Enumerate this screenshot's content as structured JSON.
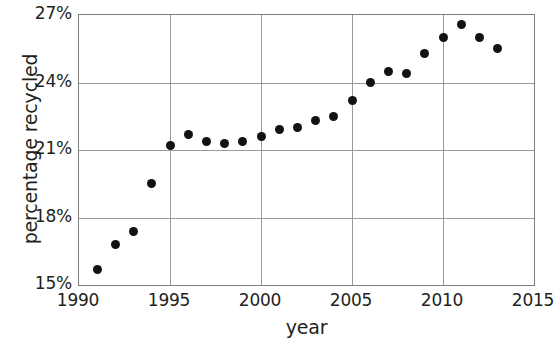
{
  "chart_data": {
    "type": "scatter",
    "title": "",
    "xlabel": "year",
    "ylabel": "percentage recycled",
    "xlim": [
      1990,
      2015
    ],
    "ylim": [
      15,
      27
    ],
    "xticks": [
      1990,
      1995,
      2000,
      2005,
      2010,
      2015
    ],
    "xtick_labels": [
      "1990",
      "1995",
      "2000",
      "2005",
      "2010",
      "2015"
    ],
    "yticks": [
      15,
      18,
      21,
      24,
      27
    ],
    "ytick_labels": [
      "15%",
      "18%",
      "21%",
      "24%",
      "27%"
    ],
    "grid": true,
    "legend": "none",
    "marker": "filled-circle",
    "marker_color": "#121212",
    "grid_color": "#9a9a9a",
    "axis_color": "#7f7f7f",
    "background_color": "#ffffff",
    "series": [
      {
        "name": "percentage recycled",
        "x": [
          1991,
          1992,
          1993,
          1994,
          1995,
          1996,
          1997,
          1998,
          1999,
          2000,
          2001,
          2002,
          2003,
          2004,
          2005,
          2006,
          2007,
          2008,
          2009,
          2010,
          2011,
          2012,
          2013
        ],
        "y": [
          15.7,
          16.8,
          17.4,
          19.5,
          21.2,
          21.7,
          21.4,
          21.3,
          21.4,
          21.6,
          21.9,
          22.0,
          22.3,
          22.5,
          23.2,
          24.0,
          24.5,
          24.4,
          25.3,
          26.0,
          26.6,
          26.0,
          25.5
        ]
      }
    ]
  }
}
